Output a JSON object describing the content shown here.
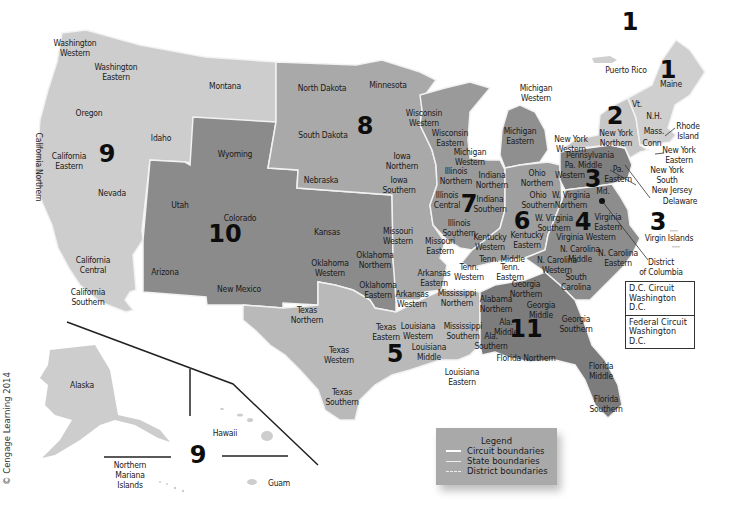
{
  "colors": {
    "background": "#ffffff",
    "circuit_light": "#cfcfcf",
    "circuit_mid_light": "#bdbdbd",
    "circuit_mid": "#a6a6a6",
    "circuit_dark": "#8a8a8a",
    "circuit_darker": "#777777",
    "boundary": "#f2f2f2",
    "text": "#1a1a1a"
  },
  "circuit_numbers": [
    {
      "id": "1a",
      "label": "1",
      "x": 630,
      "y": 22
    },
    {
      "id": "1b",
      "label": "1",
      "x": 668,
      "y": 70
    },
    {
      "id": "2",
      "label": "2",
      "x": 615,
      "y": 116
    },
    {
      "id": "3a",
      "label": "3",
      "x": 593,
      "y": 179
    },
    {
      "id": "3b",
      "label": "3",
      "x": 658,
      "y": 222
    },
    {
      "id": "4",
      "label": "4",
      "x": 583,
      "y": 222
    },
    {
      "id": "5",
      "label": "5",
      "x": 395,
      "y": 354
    },
    {
      "id": "6",
      "label": "6",
      "x": 522,
      "y": 221
    },
    {
      "id": "7",
      "label": "7",
      "x": 469,
      "y": 204
    },
    {
      "id": "8",
      "label": "8",
      "x": 365,
      "y": 126
    },
    {
      "id": "9a",
      "label": "9",
      "x": 107,
      "y": 154
    },
    {
      "id": "9b",
      "label": "9",
      "x": 198,
      "y": 455
    },
    {
      "id": "10",
      "label": "10",
      "x": 225,
      "y": 234
    },
    {
      "id": "11",
      "label": "11",
      "x": 526,
      "y": 329
    }
  ],
  "districts": [
    {
      "name": "Washington\nWestern",
      "x": 75,
      "y": 48
    },
    {
      "name": "Washington\nEastern",
      "x": 116,
      "y": 72
    },
    {
      "name": "Montana",
      "x": 225,
      "y": 86
    },
    {
      "name": "Oregon",
      "x": 89,
      "y": 113
    },
    {
      "name": "Idaho",
      "x": 161,
      "y": 138
    },
    {
      "name": "California\nEastern",
      "x": 69,
      "y": 161
    },
    {
      "name": "Nevada",
      "x": 112,
      "y": 193
    },
    {
      "name": "California\nCentral",
      "x": 93,
      "y": 265
    },
    {
      "name": "California\nSouthern",
      "x": 88,
      "y": 297
    },
    {
      "name": "Arizona",
      "x": 165,
      "y": 272
    },
    {
      "name": "Wyoming",
      "x": 235,
      "y": 154
    },
    {
      "name": "Utah",
      "x": 180,
      "y": 205
    },
    {
      "name": "Colorado",
      "x": 240,
      "y": 218
    },
    {
      "name": "New Mexico",
      "x": 239,
      "y": 289
    },
    {
      "name": "North Dakota",
      "x": 322,
      "y": 88
    },
    {
      "name": "South Dakota",
      "x": 323,
      "y": 135
    },
    {
      "name": "Nebraska",
      "x": 321,
      "y": 180
    },
    {
      "name": "Kansas",
      "x": 327,
      "y": 232
    },
    {
      "name": "Minnesota",
      "x": 388,
      "y": 85
    },
    {
      "name": "Iowa\nNorthern",
      "x": 402,
      "y": 161
    },
    {
      "name": "Iowa\nSouthern",
      "x": 399,
      "y": 185
    },
    {
      "name": "Missouri\nWestern",
      "x": 398,
      "y": 236
    },
    {
      "name": "Missouri\nEastern",
      "x": 440,
      "y": 246
    },
    {
      "name": "Wisconsin\nWestern",
      "x": 424,
      "y": 118
    },
    {
      "name": "Wisconsin\nEastern",
      "x": 450,
      "y": 138
    },
    {
      "name": "Michigan\nWestern",
      "x": 536,
      "y": 93
    },
    {
      "name": "Michigan\nWestern",
      "x": 470,
      "y": 157
    },
    {
      "name": "Michigan\nEastern",
      "x": 520,
      "y": 136
    },
    {
      "name": "Illinois\nNorthern",
      "x": 456,
      "y": 176
    },
    {
      "name": "Illinois\nCentral",
      "x": 447,
      "y": 200
    },
    {
      "name": "Illinois\nSouthern",
      "x": 459,
      "y": 228
    },
    {
      "name": "Indiana\nNorthern",
      "x": 492,
      "y": 180
    },
    {
      "name": "Indiana\nSouthern",
      "x": 490,
      "y": 204
    },
    {
      "name": "Ohio\nNorthern",
      "x": 537,
      "y": 178
    },
    {
      "name": "Ohio\nSouthern",
      "x": 538,
      "y": 200
    },
    {
      "name": "Oklahoma\nNorthern",
      "x": 375,
      "y": 260
    },
    {
      "name": "Oklahoma\nWestern",
      "x": 330,
      "y": 268
    },
    {
      "name": "Oklahoma\nEastern",
      "x": 378,
      "y": 290
    },
    {
      "name": "Arkansas\nEastern",
      "x": 434,
      "y": 278
    },
    {
      "name": "Arkansas\nWestern",
      "x": 412,
      "y": 299
    },
    {
      "name": "Texas\nNorthern",
      "x": 307,
      "y": 315
    },
    {
      "name": "Texas\nEastern",
      "x": 386,
      "y": 332
    },
    {
      "name": "Texas\nWestern",
      "x": 339,
      "y": 355
    },
    {
      "name": "Texas\nSouthern",
      "x": 342,
      "y": 397
    },
    {
      "name": "Louisiana\nWestern",
      "x": 418,
      "y": 331
    },
    {
      "name": "Louisiana\nMiddle",
      "x": 429,
      "y": 352
    },
    {
      "name": "Louisiana\nEastern",
      "x": 462,
      "y": 377
    },
    {
      "name": "Mississippi\nNorthern",
      "x": 457,
      "y": 298
    },
    {
      "name": "Mississippi\nSouthern",
      "x": 463,
      "y": 331
    },
    {
      "name": "Kentucky\nWestern",
      "x": 490,
      "y": 242
    },
    {
      "name": "Kentucky\nEastern",
      "x": 527,
      "y": 240
    },
    {
      "name": "Tenn. Middle",
      "x": 502,
      "y": 259
    },
    {
      "name": "Tenn.\nWestern",
      "x": 469,
      "y": 272
    },
    {
      "name": "Tenn.\nEastern",
      "x": 510,
      "y": 272
    },
    {
      "name": "Alabama\nNorthern",
      "x": 496,
      "y": 304
    },
    {
      "name": "Ala.\nMiddle",
      "x": 506,
      "y": 327
    },
    {
      "name": "Ala.\nSouthern",
      "x": 491,
      "y": 341
    },
    {
      "name": "Florida Northern",
      "x": 526,
      "y": 358
    },
    {
      "name": "Georgia\nNorthern",
      "x": 526,
      "y": 289
    },
    {
      "name": "Georgia\nMiddle",
      "x": 541,
      "y": 310
    },
    {
      "name": "Georgia\nSouthern",
      "x": 576,
      "y": 324
    },
    {
      "name": "Florida\nMiddle",
      "x": 601,
      "y": 371
    },
    {
      "name": "Florida\nSouthern",
      "x": 606,
      "y": 404
    },
    {
      "name": "Pennsylvania\nMiddle",
      "x": 590,
      "y": 160
    },
    {
      "name": "Pa.\nWestern",
      "x": 570,
      "y": 170
    },
    {
      "name": "Pa.\nEastern",
      "x": 618,
      "y": 174
    },
    {
      "name": "Md.",
      "x": 603,
      "y": 191
    },
    {
      "name": "W. Virginia\nNorthern",
      "x": 571,
      "y": 200
    },
    {
      "name": "W. Virginia\nSouthern",
      "x": 554,
      "y": 223
    },
    {
      "name": "Virginia\nEastern",
      "x": 608,
      "y": 222
    },
    {
      "name": "Virginia Western",
      "x": 586,
      "y": 237
    },
    {
      "name": "N. Carolina\nMiddle",
      "x": 580,
      "y": 254
    },
    {
      "name": "N. Carolina\nEastern",
      "x": 618,
      "y": 258
    },
    {
      "name": "N. Carolina\nWestern",
      "x": 557,
      "y": 265
    },
    {
      "name": "South\nCarolina",
      "x": 576,
      "y": 282
    },
    {
      "name": "New York\nWestern",
      "x": 571,
      "y": 144
    },
    {
      "name": "New York\nNorthern",
      "x": 616,
      "y": 138
    },
    {
      "name": "Vt.",
      "x": 637,
      "y": 104
    },
    {
      "name": "N.H.",
      "x": 654,
      "y": 116
    },
    {
      "name": "Mass.",
      "x": 654,
      "y": 131
    },
    {
      "name": "Conn",
      "x": 652,
      "y": 143
    },
    {
      "name": "Rhode\nIsland",
      "x": 688,
      "y": 131
    },
    {
      "name": "New York\nEastern",
      "x": 679,
      "y": 155
    },
    {
      "name": "New York\nSouth",
      "x": 667,
      "y": 175
    },
    {
      "name": "New Jersey",
      "x": 672,
      "y": 190
    },
    {
      "name": "Delaware",
      "x": 680,
      "y": 201
    },
    {
      "name": "Maine",
      "x": 671,
      "y": 84
    },
    {
      "name": "Puerto Rico",
      "x": 626,
      "y": 70
    },
    {
      "name": "Virgin Islands",
      "x": 669,
      "y": 238
    },
    {
      "name": "District\nof Columbia",
      "x": 661,
      "y": 267
    },
    {
      "name": "Alaska",
      "x": 82,
      "y": 385
    },
    {
      "name": "Hawaii",
      "x": 225,
      "y": 433
    },
    {
      "name": "Northern\nMariana\nIslands",
      "x": 130,
      "y": 475
    },
    {
      "name": "Guam",
      "x": 279,
      "y": 483
    }
  ],
  "dc_box": [
    "D.C. Circuit\nWashington D.C.",
    "Federal Circuit\nWashington D.C."
  ],
  "legend": {
    "title": "Legend",
    "items": [
      {
        "type": "circuit",
        "label": "Circuit boundaries"
      },
      {
        "type": "state",
        "label": "State boundaries"
      },
      {
        "type": "district",
        "label": "District boundaries"
      }
    ]
  },
  "vertical_label": "California Northern",
  "copyright": "© Cengage Learning 2014"
}
